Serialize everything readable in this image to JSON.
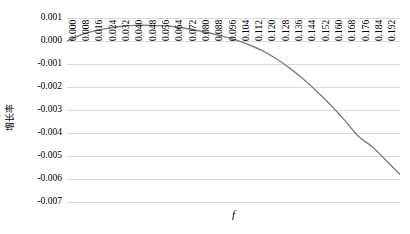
{
  "chart_data": {
    "type": "line",
    "title": "",
    "xlabel": "f",
    "ylabel": "增长率",
    "xlim": [
      0.0,
      0.192
    ],
    "ylim": [
      -0.007,
      0.001
    ],
    "grid": true,
    "legend": false,
    "line_color": "#808080",
    "grid_color": "#d9d9d9",
    "y_ticks": [
      "0.001",
      "0.000",
      "-0.001",
      "-0.002",
      "-0.003",
      "-0.004",
      "-0.005",
      "-0.006",
      "-0.007"
    ],
    "y_tick_values": [
      0.001,
      0.0,
      -0.001,
      -0.002,
      -0.003,
      -0.004,
      -0.005,
      -0.006,
      -0.007
    ],
    "x_ticks": [
      "0.000",
      "0.008",
      "0.016",
      "0.024",
      "0.032",
      "0.040",
      "0.048",
      "0.056",
      "0.064",
      "0.072",
      "0.080",
      "0.088",
      "0.096",
      "0.104",
      "0.112",
      "0.120",
      "0.128",
      "0.136",
      "0.144",
      "0.152",
      "0.160",
      "0.168",
      "0.176",
      "0.184",
      "0.192"
    ],
    "x": [
      0.0,
      0.008,
      0.016,
      0.024,
      0.032,
      0.04,
      0.048,
      0.056,
      0.064,
      0.072,
      0.08,
      0.088,
      0.096,
      0.104,
      0.112,
      0.12,
      0.128,
      0.136,
      0.144,
      0.152,
      0.16,
      0.168,
      0.176,
      0.184,
      0.192
    ],
    "values": [
      0.0,
      0.00026,
      0.00044,
      0.00056,
      0.00064,
      0.00068,
      0.00068,
      0.00066,
      0.0006,
      0.0005,
      0.00038,
      0.00024,
      8e-05,
      -0.00014,
      -0.0004,
      -0.00074,
      -0.00116,
      -0.00164,
      -0.00218,
      -0.00278,
      -0.00344,
      -0.00414,
      -0.0046,
      -0.0052,
      -0.0058
    ],
    "series": [
      {
        "name": "增长率",
        "values": [
          0.0,
          0.00026,
          0.00044,
          0.00056,
          0.00064,
          0.00068,
          0.00068,
          0.00066,
          0.0006,
          0.0005,
          0.00038,
          0.00024,
          8e-05,
          -0.00014,
          -0.0004,
          -0.00074,
          -0.00116,
          -0.00164,
          -0.00218,
          -0.00278,
          -0.00344,
          -0.00414,
          -0.0046,
          -0.0052,
          -0.0058
        ]
      }
    ],
    "peak": {
      "x": 0.048,
      "y": 0.00068
    },
    "zero_crossing": {
      "x": 0.1075,
      "y": 0.0
    }
  }
}
